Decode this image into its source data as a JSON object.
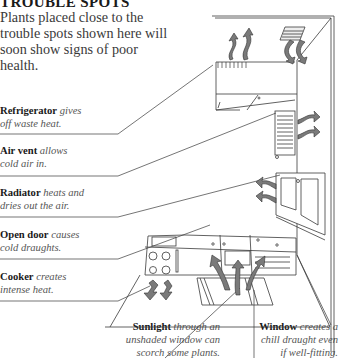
{
  "title": "TROUBLE SPOTS",
  "intro": "Plants placed close to the trouble spots shown here will soon show signs of poor health.",
  "labels": [
    {
      "id": "refrigerator",
      "term": "Refrigerator",
      "desc": " gives",
      "desc2": "off waste heat."
    },
    {
      "id": "air-vent",
      "term": "Air vent",
      "desc": " allows",
      "desc2": "cold air in."
    },
    {
      "id": "radiator",
      "term": "Radiator",
      "desc": " heats and",
      "desc2": "dries out the air."
    },
    {
      "id": "open-door",
      "term": "Open door",
      "desc": " causes",
      "desc2": "cold draughts."
    },
    {
      "id": "cooker",
      "term": "Cooker",
      "desc": " creates",
      "desc2": "intense heat."
    },
    {
      "id": "sunlight",
      "term": "Sunlight",
      "desc": " through an",
      "desc2": "unshaded window can",
      "desc3": "scorch some plants."
    },
    {
      "id": "window",
      "term": "Window",
      "desc": " creates a",
      "desc2": "chill draught even",
      "desc3": "if well-fitting."
    }
  ],
  "colors": {
    "line": "#3a3a3a",
    "arrow": "#7a7a7a",
    "arrow_edge": "#333333"
  }
}
